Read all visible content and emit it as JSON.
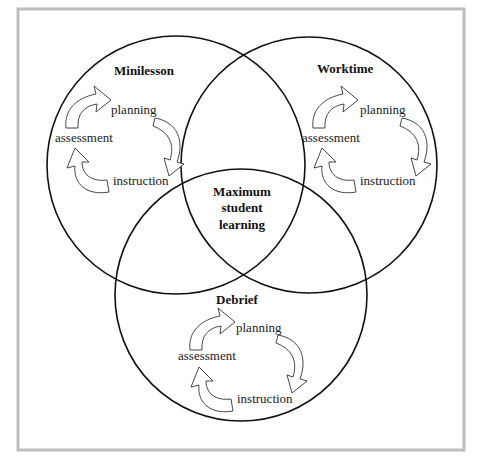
{
  "diagram": {
    "type": "venn",
    "center_label": [
      "Maximum",
      "student",
      "learning"
    ],
    "sets": [
      {
        "id": "minilesson",
        "title": "Minilesson",
        "cycle": {
          "planning": "planning",
          "instruction": "instruction",
          "assessment": "assessment"
        }
      },
      {
        "id": "worktime",
        "title": "Worktime",
        "cycle": {
          "planning": "planning",
          "instruction": "instruction",
          "assessment": "assessment"
        }
      },
      {
        "id": "debrief",
        "title": "Debrief",
        "cycle": {
          "planning": "planning",
          "instruction": "instruction",
          "assessment": "assessment"
        }
      }
    ]
  },
  "colors": {
    "frame": "#bdbdbd",
    "circle_stroke": "#111111",
    "text": "#1a1a1a",
    "background": "#ffffff"
  }
}
